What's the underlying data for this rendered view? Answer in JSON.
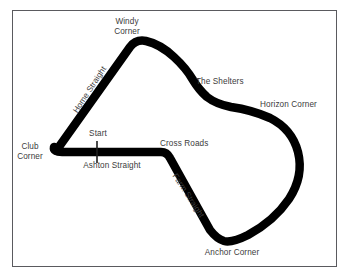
{
  "diagram": {
    "type": "racing-circuit-map",
    "background_color": "#ffffff",
    "track_color": "#000000",
    "label_color": "#3c3c3c",
    "frame_color": "#5a5a5e",
    "labels": {
      "windy_corner": "Windy\nCorner",
      "the_shelters": "The Shelters",
      "horizon_corner": "Horizon Corner",
      "club_corner": "Club\nCorner",
      "start": "Start",
      "ashton_straight": "Ashton Straight",
      "cross_roads": "Cross Roads",
      "anchor_corner": "Anchor Corner",
      "home_straight": "Home Straight",
      "farm_straight": "Farm Straight"
    }
  }
}
